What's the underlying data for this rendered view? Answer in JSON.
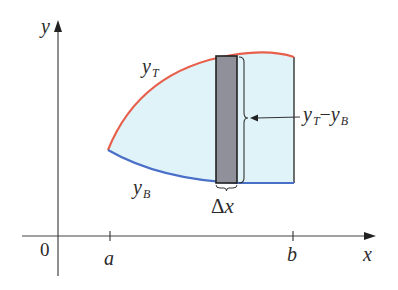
{
  "figure": {
    "axes": {
      "x_label": "x",
      "y_label": "y",
      "origin_label": "0",
      "ticks": [
        {
          "name": "a",
          "label": "a"
        },
        {
          "name": "b",
          "label": "b"
        }
      ]
    },
    "curves": {
      "top": {
        "label_main": "y",
        "label_sub": "T",
        "color": "#e8604c"
      },
      "bottom": {
        "label_main": "y",
        "label_sub": "B",
        "color": "#4a6fc8"
      }
    },
    "region": {
      "fill_color": "#dff3f9",
      "edge_color": "#333333"
    },
    "strip": {
      "fill_color": "#8f9099",
      "edge_color": "#222222",
      "width_label_delta": "Δ",
      "width_label_var": "x"
    },
    "height_annotation": {
      "top_main": "y",
      "top_sub": "T",
      "minus": "−",
      "bottom_main": "y",
      "bottom_sub": "B"
    }
  }
}
